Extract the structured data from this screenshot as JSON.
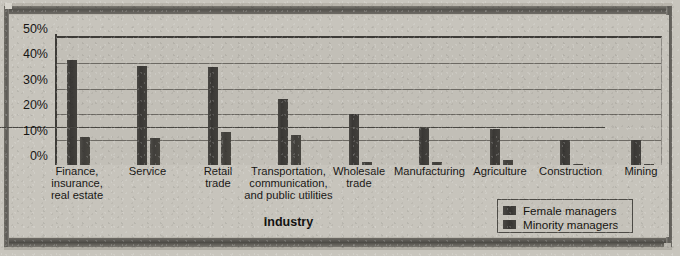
{
  "chart_data": {
    "type": "bar",
    "title": "",
    "xlabel": "Industry",
    "ylabel": "",
    "ylim": [
      0,
      50
    ],
    "ytick_labels": [
      "50%",
      "40%",
      "30%",
      "20%",
      "10%",
      "0%"
    ],
    "ytick_values": [
      50,
      40,
      30,
      20,
      10,
      0
    ],
    "grid": true,
    "legend_position": "bottom-right",
    "categories": [
      "Finance,\ninsurance,\nreal estate",
      "Service",
      "Retail\ntrade",
      "Transportation,\ncommunication,\nand public utilities",
      "Wholesale\ntrade",
      "Manufacturing",
      "Agriculture",
      "Construction",
      "Mining"
    ],
    "series": [
      {
        "name": "Female managers",
        "color": "#3a3835",
        "values": [
          41.5,
          39,
          38.5,
          26,
          20,
          15,
          14,
          10,
          10
        ]
      },
      {
        "name": "Minority managers",
        "color": "#403e3a",
        "values": [
          11,
          10.5,
          13,
          12,
          1,
          1,
          2,
          0.5,
          0.5
        ]
      }
    ]
  },
  "legend": {
    "items": [
      {
        "label": "Female managers"
      },
      {
        "label": "Minority managers"
      }
    ]
  },
  "axis": {
    "x_title": "Industry"
  }
}
